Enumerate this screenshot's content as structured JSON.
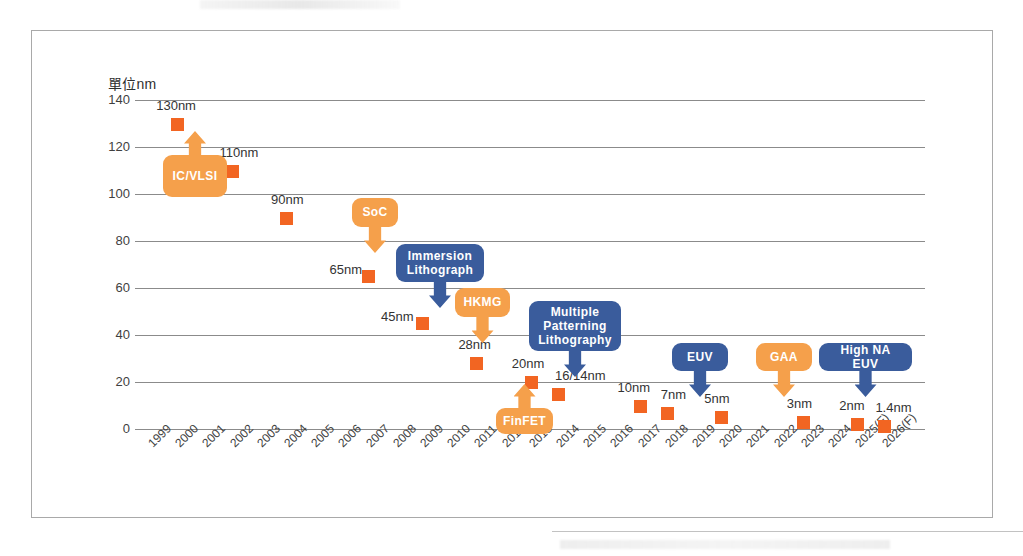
{
  "chart_data": {
    "type": "scatter",
    "title": "",
    "ylabel": "單位nm",
    "xlabel": "",
    "ylim": [
      0,
      140
    ],
    "ytick_values": [
      140,
      120,
      100,
      80,
      60,
      40,
      20,
      0
    ],
    "ytick_labels": [
      "140",
      "120",
      "100",
      "80",
      "60",
      "40",
      "20",
      "0"
    ],
    "grid": true,
    "legend": "none",
    "categories": [
      "1999",
      "2000",
      "2001",
      "2002",
      "2003",
      "2004",
      "2005",
      "2006",
      "2007",
      "2008",
      "2009",
      "2010",
      "2011",
      "2012",
      "2013",
      "2014",
      "2015",
      "2016",
      "2017",
      "2018",
      "2019",
      "2020",
      "2021",
      "2022",
      "2023",
      "2024",
      "2025(F)",
      "2026(F)"
    ],
    "points": [
      {
        "x": "2000",
        "y": 130,
        "label": "130nm"
      },
      {
        "x": "2002",
        "y": 110,
        "label": "110nm"
      },
      {
        "x": "2004",
        "y": 90,
        "label": "90nm"
      },
      {
        "x": "2007",
        "y": 65,
        "label": "65nm"
      },
      {
        "x": "2009",
        "y": 45,
        "label": "45nm"
      },
      {
        "x": "2011",
        "y": 28,
        "label": "28nm"
      },
      {
        "x": "2013",
        "y": 20,
        "label": "20nm"
      },
      {
        "x": "2014",
        "y": 15,
        "label": "16/14nm"
      },
      {
        "x": "2017",
        "y": 10,
        "label": "10nm"
      },
      {
        "x": "2018",
        "y": 7,
        "label": "7nm"
      },
      {
        "x": "2020",
        "y": 5,
        "label": "5nm"
      },
      {
        "x": "2023",
        "y": 3,
        "label": "3nm"
      },
      {
        "x": "2025(F)",
        "y": 2,
        "label": "2nm"
      },
      {
        "x": "2026(F)",
        "y": 1.4,
        "label": "1.4nm"
      }
    ],
    "annotations": [
      {
        "text": "IC/VLSI",
        "color": "orange",
        "direction": "up",
        "target_x": "2000",
        "target_y": 130
      },
      {
        "text": "SoC",
        "color": "orange",
        "direction": "down",
        "target_x": "2007",
        "target_y": 65
      },
      {
        "text": "Immersion\nLithograph",
        "color": "blue",
        "direction": "down",
        "target_x": "2009",
        "target_y": 45
      },
      {
        "text": "HKMG",
        "color": "orange",
        "direction": "down",
        "target_x": "2011",
        "target_y": 28
      },
      {
        "text": "Multiple\nPatterning\nLithography",
        "color": "blue",
        "direction": "down",
        "target_x": "2014",
        "target_y": 15
      },
      {
        "text": "FinFET",
        "color": "orange",
        "direction": "up",
        "target_x": "2013",
        "target_y": 20
      },
      {
        "text": "EUV",
        "color": "blue",
        "direction": "down",
        "target_x": "2020",
        "target_y": 5
      },
      {
        "text": "GAA",
        "color": "orange",
        "direction": "down",
        "target_x": "2023",
        "target_y": 3
      },
      {
        "text": "High NA EUV",
        "color": "blue",
        "direction": "down",
        "target_x": "2026(F)",
        "target_y": 1.4
      }
    ],
    "colors": {
      "marker": "#f26522",
      "orange_callout": "#f5a04b",
      "blue_callout": "#3a5c9c",
      "gridline": "#8b8b8b",
      "frame": "#a9a9a9",
      "text": "#3a3a3a"
    }
  },
  "layout": {
    "plot_left": 135,
    "plot_right": 925,
    "y_top_px": 100,
    "y_bottom_px": 429,
    "x_first_px": 150,
    "x_step_px": 27.2,
    "callout_positions": [
      {
        "text": "IC/VLSI",
        "left": 163,
        "top": 155,
        "width": 64,
        "height": 42,
        "stem_top": -24
      },
      {
        "text": "SoC",
        "left": 352,
        "top": 198,
        "width": 46,
        "height": 29,
        "stem_top": 29
      },
      {
        "text": "Immersion\nLithograph",
        "left": 396,
        "top": 244,
        "width": 88,
        "height": 38,
        "stem_top": 38
      },
      {
        "text": "HKMG",
        "left": 455,
        "top": 288,
        "width": 55,
        "height": 29,
        "stem_top": 29
      },
      {
        "text": "Multiple\nPatterning\nLithography",
        "left": 529,
        "top": 301,
        "width": 92,
        "height": 50,
        "stem_top": 50
      },
      {
        "text": "FinFET",
        "left": 496,
        "top": 408,
        "width": 57,
        "height": 26,
        "stem_top": -24
      },
      {
        "text": "EUV",
        "left": 672,
        "top": 343,
        "width": 56,
        "height": 28,
        "stem_top": 28
      },
      {
        "text": "GAA",
        "left": 756,
        "top": 343,
        "width": 56,
        "height": 28,
        "stem_top": 28
      },
      {
        "text": "High NA EUV",
        "left": 819,
        "top": 343,
        "width": 93,
        "height": 28,
        "stem_top": 28
      }
    ],
    "label_offsets": [
      {
        "label": "130nm",
        "dx": -21,
        "dy": -25
      },
      {
        "label": "110nm",
        "dx": -12,
        "dy": -25
      },
      {
        "label": "90nm",
        "dx": -15,
        "dy": -25
      },
      {
        "label": "65nm",
        "dx": -38,
        "dy": -13
      },
      {
        "label": "45nm",
        "dx": -41,
        "dy": -13
      },
      {
        "label": "28nm",
        "dx": -18,
        "dy": -25
      },
      {
        "label": "20nm",
        "dx": -19,
        "dy": -25
      },
      {
        "label": "16/14nm",
        "dx": -3,
        "dy": -25
      },
      {
        "label": "10nm",
        "dx": -22,
        "dy": -25
      },
      {
        "label": "7nm",
        "dx": -6,
        "dy": -25
      },
      {
        "label": "5nm",
        "dx": -17,
        "dy": -25
      },
      {
        "label": "3nm",
        "dx": -16,
        "dy": -25
      },
      {
        "label": "2nm",
        "dx": -18,
        "dy": -25
      },
      {
        "label": "1.4nm",
        "dx": -9,
        "dy": -25
      }
    ]
  }
}
